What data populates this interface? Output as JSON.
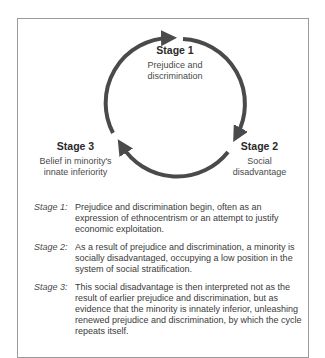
{
  "diagram": {
    "type": "cycle",
    "stages": [
      {
        "title": "Stage 1",
        "description_lines": [
          "Prejudice and",
          "discrimination"
        ]
      },
      {
        "title": "Stage 2",
        "description_lines": [
          "Social",
          "disadvantage"
        ]
      },
      {
        "title": "Stage 3",
        "description_lines": [
          "Belief in minority's",
          "innate inferiority"
        ]
      }
    ],
    "arrow_color": "#4a4a4a"
  },
  "legend": [
    {
      "key": "Stage 1:",
      "text": "Prejudice and discrimination begin, often as an expression of ethnocentrism or an attempt to justify economic exploitation."
    },
    {
      "key": "Stage 2:",
      "text": "As a result of prejudice and discrimination, a minority is socially disadvantaged, occupying a low position in the system of social stratification."
    },
    {
      "key": "Stage 3:",
      "text": "This social disadvantage is then interpreted not as the result of earlier prejudice and discrimination, but as evidence that the minority is innately inferior, unleashing renewed prejudice and discrimination, by which the cycle repeats itself."
    }
  ]
}
